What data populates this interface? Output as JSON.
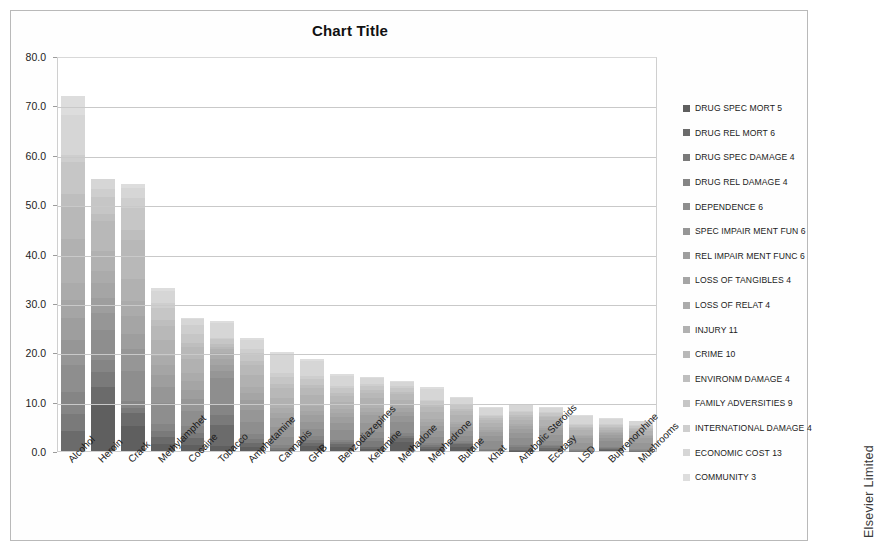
{
  "chart": {
    "title": "Chart Title",
    "credit": "Elsevier Limited"
  },
  "chart_data": {
    "type": "bar",
    "subtype": "stacked-bar",
    "title": "Chart Title",
    "xlabel": "",
    "ylabel": "",
    "ylim": [
      0,
      80
    ],
    "ytick_labels": [
      "0.0",
      "10.0",
      "20.0",
      "30.0",
      "40.0",
      "50.0",
      "60.0",
      "70.0",
      "80.0"
    ],
    "ytick_values": [
      0,
      10,
      20,
      30,
      40,
      50,
      60,
      70,
      80
    ],
    "grid": true,
    "legend_position": "right",
    "categories": [
      "Alcohol",
      "Heroin",
      "Crack",
      "Methylamphet",
      "Cocaine",
      "Tobacco",
      "Amphetamine",
      "Cannabis",
      "GHB",
      "Benzodiazepines",
      "Ketamine",
      "Methadone",
      "Mephedrone",
      "Butane",
      "Khat",
      "Anabolic Steroids",
      "Ecstasy",
      "LSD",
      "Buprenorphine",
      "Mushrooms"
    ],
    "totals": [
      72.0,
      55.0,
      54.0,
      33.0,
      27.0,
      26.3,
      23.0,
      20.0,
      18.7,
      15.7,
      15.1,
      14.2,
      12.9,
      10.9,
      9.0,
      9.5,
      9.0,
      7.3,
      6.7,
      6.1
    ],
    "series": [
      {
        "name": "DRUG SPEC MORT 5",
        "color": "#5f5f5f",
        "weight": 5,
        "values": [
          0.0,
          9.5,
          5.0,
          1.5,
          1.3,
          1.0,
          0.8,
          0.0,
          1.0,
          0.9,
          0.4,
          1.8,
          0.5,
          0.9,
          0.0,
          0.1,
          0.3,
          0.0,
          0.3,
          0.0
        ]
      },
      {
        "name": "DRUG REL MORT 6",
        "color": "#6b6b6b",
        "weight": 6,
        "values": [
          4.0,
          3.5,
          2.6,
          1.4,
          1.4,
          4.2,
          0.8,
          0.3,
          0.7,
          0.5,
          0.5,
          0.8,
          0.4,
          0.5,
          0.0,
          0.2,
          0.4,
          0.0,
          0.2,
          0.0
        ]
      },
      {
        "name": "DRUG SPEC DAMAGE 4",
        "color": "#7a7a7a",
        "weight": 4,
        "values": [
          3.5,
          3.0,
          1.2,
          1.2,
          1.0,
          2.1,
          0.9,
          0.4,
          0.6,
          0.5,
          1.1,
          0.5,
          0.4,
          0.3,
          0.2,
          0.5,
          0.3,
          0.1,
          0.2,
          0.1
        ]
      },
      {
        "name": "DRUG REL DAMAGE 4",
        "color": "#858585",
        "weight": 4,
        "values": [
          4.5,
          2.5,
          1.4,
          1.3,
          1.3,
          2.0,
          0.9,
          0.5,
          0.7,
          0.4,
          0.6,
          0.5,
          0.4,
          0.4,
          0.2,
          0.4,
          0.3,
          0.1,
          0.2,
          0.1
        ]
      },
      {
        "name": "DEPENDENCE 6",
        "color": "#8e8e8e",
        "weight": 6,
        "values": [
          5.5,
          6.0,
          6.0,
          4.3,
          3.2,
          5.5,
          2.5,
          1.6,
          1.4,
          2.0,
          1.2,
          2.3,
          1.2,
          0.9,
          1.6,
          1.4,
          0.8,
          0.3,
          1.2,
          0.2
        ]
      },
      {
        "name": "SPEC IMPAIR MENT FUN 6",
        "color": "#969696",
        "weight": 6,
        "values": [
          5.0,
          3.5,
          4.4,
          3.3,
          2.3,
          1.4,
          2.4,
          2.1,
          1.5,
          1.4,
          1.9,
          1.1,
          1.2,
          1.0,
          1.0,
          1.1,
          1.2,
          1.2,
          0.6,
          1.3
        ]
      },
      {
        "name": "REL IMPAIR MENT FUNC 6",
        "color": "#9e9e9e",
        "weight": 6,
        "values": [
          4.5,
          3.0,
          3.2,
          2.5,
          1.9,
          1.3,
          2.0,
          1.8,
          1.3,
          1.2,
          1.5,
          0.9,
          1.0,
          0.8,
          0.8,
          0.8,
          0.9,
          0.9,
          0.5,
          1.0
        ]
      },
      {
        "name": "LOSS OF TANGIBLES 4",
        "color": "#a5a5a5",
        "weight": 4,
        "values": [
          3.5,
          3.0,
          3.5,
          2.0,
          1.8,
          1.2,
          1.4,
          1.1,
          1.0,
          0.9,
          0.8,
          0.8,
          0.7,
          0.6,
          0.5,
          0.5,
          0.5,
          0.4,
          0.4,
          0.3
        ]
      },
      {
        "name": "LOSS OF RELAT 4",
        "color": "#ababab",
        "weight": 4,
        "values": [
          3.5,
          2.5,
          3.0,
          1.7,
          1.6,
          1.1,
          1.2,
          1.0,
          0.9,
          0.8,
          0.7,
          0.7,
          0.6,
          0.5,
          0.5,
          0.4,
          0.4,
          0.3,
          0.3,
          0.3
        ]
      },
      {
        "name": "INJURY 11",
        "color": "#b1b1b1",
        "weight": 11,
        "values": [
          9.0,
          4.0,
          4.5,
          3.2,
          2.8,
          0.8,
          2.5,
          2.0,
          2.3,
          1.3,
          2.0,
          0.9,
          1.5,
          1.5,
          0.9,
          0.9,
          1.1,
          0.9,
          0.4,
          0.8
        ]
      },
      {
        "name": "CRIME 10",
        "color": "#b8b8b8",
        "weight": 10,
        "values": [
          6.5,
          6.0,
          8.0,
          3.0,
          2.4,
          0.4,
          2.1,
          2.0,
          1.4,
          1.3,
          1.1,
          1.2,
          1.0,
          0.8,
          0.6,
          0.7,
          0.7,
          0.5,
          0.4,
          0.4
        ]
      },
      {
        "name": "ENVIRONM DAMAGE 4",
        "color": "#bebebe",
        "weight": 4,
        "values": [
          2.5,
          1.5,
          2.0,
          1.1,
          0.9,
          0.6,
          0.8,
          0.8,
          0.6,
          0.5,
          0.5,
          0.4,
          0.4,
          0.4,
          0.3,
          0.3,
          0.3,
          0.2,
          0.2,
          0.2
        ]
      },
      {
        "name": "FAMILY ADVERSITIES 9",
        "color": "#c6c6c6",
        "weight": 9,
        "values": [
          6.5,
          3.5,
          4.5,
          2.5,
          1.9,
          1.0,
          1.6,
          1.5,
          1.3,
          1.1,
          0.9,
          0.9,
          0.8,
          0.7,
          0.5,
          0.6,
          0.6,
          0.4,
          0.4,
          0.3
        ]
      },
      {
        "name": "INTERNATIONAL DAMAGE 4",
        "color": "#cecece",
        "weight": 4,
        "values": [
          1.5,
          1.5,
          2.0,
          1.0,
          1.7,
          0.4,
          0.7,
          0.8,
          0.5,
          0.4,
          0.4,
          0.3,
          0.3,
          0.3,
          0.2,
          0.2,
          0.2,
          0.2,
          0.2,
          0.2
        ]
      },
      {
        "name": "ECONOMIC COST 13",
        "color": "#d6d6d6",
        "weight": 13,
        "values": [
          8.0,
          2.0,
          2.0,
          2.5,
          1.2,
          3.0,
          2.0,
          3.6,
          3.0,
          2.0,
          1.2,
          0.9,
          2.2,
          1.2,
          1.4,
          1.2,
          0.8,
          1.6,
          1.1,
          0.8
        ]
      },
      {
        "name": "COMMUNITY 3",
        "color": "#dddddd",
        "weight": 3,
        "values": [
          4.0,
          0.0,
          0.7,
          0.5,
          0.3,
          0.3,
          0.4,
          0.5,
          0.5,
          0.5,
          0.3,
          0.2,
          0.3,
          0.1,
          0.3,
          0.2,
          0.2,
          0.2,
          0.1,
          0.1
        ]
      }
    ]
  }
}
